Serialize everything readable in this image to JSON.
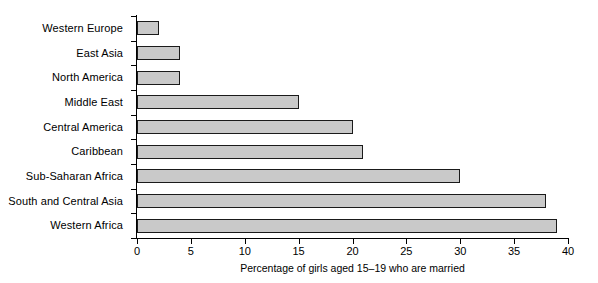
{
  "chart_data": {
    "type": "bar",
    "orientation": "horizontal",
    "title": "",
    "subtitle": "",
    "xlabel": "Percentage of girls aged 15–19 who are married",
    "ylabel": "",
    "categories": [
      "Western Europe",
      "East Asia",
      "North America",
      "Middle East",
      "Central America",
      "Caribbean",
      "Sub-Saharan Africa",
      "South and Central Asia",
      "Western Africa"
    ],
    "values": [
      2,
      4,
      4,
      15,
      20,
      21,
      30,
      38,
      39
    ],
    "xlim": [
      0,
      40
    ],
    "xticks": [
      0,
      5,
      10,
      15,
      20,
      25,
      30,
      35,
      40
    ],
    "xtick_labels": [
      "0",
      "5",
      "10",
      "15",
      "20",
      "25",
      "30",
      "35",
      "40"
    ],
    "grid": false,
    "legend": null,
    "bar_fill_color": "#c9c9c9",
    "bar_border_color": "#1a1a1a",
    "axis_color": "#000000",
    "background_color": "#ffffff"
  }
}
